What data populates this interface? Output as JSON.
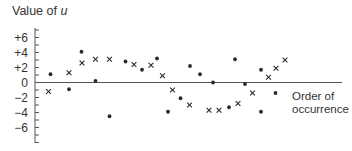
{
  "chart_data": {
    "type": "scatter",
    "title": "Value of u",
    "title_parts": {
      "prefix": "Value of ",
      "variable": "u"
    },
    "xlabel": "Order of occurrence",
    "xlabel_lines": [
      "Order of",
      "occurrence"
    ],
    "ylabel": "Value of u",
    "ylim": [
      -8,
      7
    ],
    "y_ticks": [
      6,
      4,
      2,
      0,
      -2,
      -4,
      -6
    ],
    "y_tick_labels": [
      "+6",
      "+4",
      "+2",
      "0",
      "−2",
      "−4",
      "−6"
    ],
    "minor_tick_step": 1,
    "grid": false,
    "legend": null,
    "markers": {
      "dot": "filled circle",
      "cross": "x"
    },
    "series": [
      {
        "name": "dot",
        "marker": "•",
        "points": [
          {
            "x": 50.5,
            "u": 1.1
          },
          {
            "x": 69,
            "u": -0.9
          },
          {
            "x": 81.5,
            "u": 4.1
          },
          {
            "x": 95.5,
            "u": 0.2
          },
          {
            "x": 109.5,
            "u": -4.5
          },
          {
            "x": 125.5,
            "u": 2.8
          },
          {
            "x": 142,
            "u": 1.7
          },
          {
            "x": 157,
            "u": 3.2
          },
          {
            "x": 168,
            "u": -3.9
          },
          {
            "x": 180.5,
            "u": -2.1
          },
          {
            "x": 190,
            "u": 2.2
          },
          {
            "x": 200,
            "u": 1.1
          },
          {
            "x": 213,
            "u": 0.0
          },
          {
            "x": 229,
            "u": -3.3
          },
          {
            "x": 235,
            "u": 3.1
          },
          {
            "x": 245,
            "u": -0.2
          },
          {
            "x": 261,
            "u": 1.7
          },
          {
            "x": 261,
            "u": -3.9
          },
          {
            "x": 275.5,
            "u": -1.4
          }
        ]
      },
      {
        "name": "cross",
        "marker": "×",
        "points": [
          {
            "x": 48.5,
            "u": -1.2
          },
          {
            "x": 69,
            "u": 1.3
          },
          {
            "x": 82,
            "u": 2.6
          },
          {
            "x": 95.5,
            "u": 3.1
          },
          {
            "x": 109.5,
            "u": 3.1
          },
          {
            "x": 134,
            "u": 2.4
          },
          {
            "x": 151,
            "u": 2.3
          },
          {
            "x": 162.5,
            "u": 0.9
          },
          {
            "x": 172.5,
            "u": -1.0
          },
          {
            "x": 189.5,
            "u": -3.0
          },
          {
            "x": 209,
            "u": -3.7
          },
          {
            "x": 219,
            "u": -3.7
          },
          {
            "x": 238,
            "u": -2.8
          },
          {
            "x": 252.5,
            "u": -1.4
          },
          {
            "x": 268.5,
            "u": 0.7
          },
          {
            "x": 276,
            "u": 1.9
          },
          {
            "x": 285,
            "u": 3.0
          }
        ]
      }
    ],
    "colors": {
      "ink": "#2a2a2a",
      "axis": "#555555"
    }
  }
}
